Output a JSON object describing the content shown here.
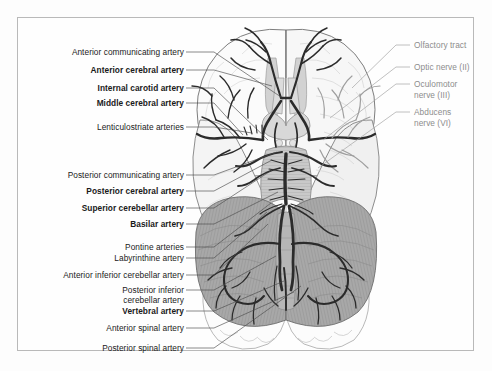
{
  "figure": {
    "background_color": "#fdfdfd",
    "frame_color": "#b9b9b9"
  },
  "labels": {
    "left_color": "#1a1a1a",
    "right_color": "#8d8d8d",
    "left": [
      {
        "text": "Anterior communicating artery",
        "bold": false,
        "x": 180,
        "y": 52,
        "tip_x": 281,
        "tip_y": 97
      },
      {
        "text": "Anterior cerebral artery",
        "bold": true,
        "x": 180,
        "y": 70,
        "tip_x": 272,
        "tip_y": 86
      },
      {
        "text": "Internal carotid artery",
        "bold": true,
        "x": 180,
        "y": 88,
        "tip_x": 268,
        "tip_y": 140
      },
      {
        "text": "Middle cerebral artery",
        "bold": true,
        "x": 180,
        "y": 103,
        "tip_x": 243,
        "tip_y": 135
      },
      {
        "text": "Lenticulostriate arteries",
        "bold": false,
        "x": 180,
        "y": 127,
        "tip_x": 252,
        "tip_y": 133
      },
      {
        "text": "Posterior communicating artery",
        "bold": false,
        "x": 180,
        "y": 175,
        "tip_x": 277,
        "tip_y": 152
      },
      {
        "text": "Posterior cerebral artery",
        "bold": true,
        "x": 180,
        "y": 191,
        "tip_x": 272,
        "tip_y": 160
      },
      {
        "text": "Superior cerebellar artery",
        "bold": true,
        "x": 180,
        "y": 208,
        "tip_x": 272,
        "tip_y": 170
      },
      {
        "text": "Basilar artery",
        "bold": true,
        "x": 180,
        "y": 224,
        "tip_x": 278,
        "tip_y": 192
      },
      {
        "text": "Pontine arteries",
        "bold": false,
        "x": 180,
        "y": 247,
        "tip_x": 271,
        "tip_y": 203
      },
      {
        "text": "Labyrinthine artery",
        "bold": false,
        "x": 180,
        "y": 258,
        "tip_x": 267,
        "tip_y": 212
      },
      {
        "text": "Anterior inferior cerebellar artery",
        "bold": false,
        "x": 180,
        "y": 275,
        "tip_x": 268,
        "tip_y": 224
      },
      {
        "text": "Posterior inferior",
        "bold": false,
        "x": 180,
        "y": 290,
        "tip_x": 276,
        "tip_y": 256
      },
      {
        "text": "cerebellar artery",
        "bold": false,
        "x": 180,
        "y": 300,
        "tip_x": null,
        "tip_y": null
      },
      {
        "text": "Vertebral artery",
        "bold": true,
        "x": 180,
        "y": 311,
        "tip_x": 284,
        "tip_y": 281
      },
      {
        "text": "Anterior spinal artery",
        "bold": false,
        "x": 180,
        "y": 328,
        "tip_x": 294,
        "tip_y": 292
      },
      {
        "text": "Posterior spinal artery",
        "bold": false,
        "x": 180,
        "y": 348,
        "tip_x": 301,
        "tip_y": 286
      }
    ],
    "right": [
      {
        "text": "Olfactory tract",
        "x": 415,
        "y": 45,
        "tip_x": 352,
        "tip_y": 88,
        "lines": [
          "Olfactory tract"
        ]
      },
      {
        "text": "Optic nerve (II)",
        "x": 415,
        "y": 67,
        "tip_x": 330,
        "tip_y": 118,
        "lines": [
          "Optic nerve (II)"
        ]
      },
      {
        "text": "Oculomotor nerve (III)",
        "x": 415,
        "y": 89,
        "tip_x": 323,
        "tip_y": 140,
        "lines": [
          "Oculomotor",
          "nerve (III)"
        ]
      },
      {
        "text": "Abducens nerve (VI)",
        "x": 415,
        "y": 117,
        "tip_x": 318,
        "tip_y": 168,
        "lines": [
          "Abducens",
          "nerve (VI)"
        ]
      }
    ]
  },
  "anatomy": {
    "regions": [
      {
        "name": "frontal-lobe-left",
        "fill": "#fbfbfb"
      },
      {
        "name": "frontal-lobe-right",
        "fill": "#f7f7f7"
      },
      {
        "name": "temporal-lobe-left",
        "fill": "#f4f4f4"
      },
      {
        "name": "temporal-lobe-right",
        "fill": "#f0f0f0"
      },
      {
        "name": "cerebellum-left",
        "fill": "#a8a8a8"
      },
      {
        "name": "cerebellum-right",
        "fill": "#a8a8a8"
      },
      {
        "name": "occipital-lobe-left",
        "fill": "#fbfbfb"
      },
      {
        "name": "occipital-lobe-right",
        "fill": "#fbfbfb"
      },
      {
        "name": "brainstem",
        "fill": "#cfcfcf"
      },
      {
        "name": "optic-chiasm",
        "fill": "#d6d6d6"
      },
      {
        "name": "medulla",
        "fill": "#ffffff"
      }
    ],
    "artery_color_dark": "#2b2b2b",
    "artery_color_light": "#bdbdbd"
  }
}
